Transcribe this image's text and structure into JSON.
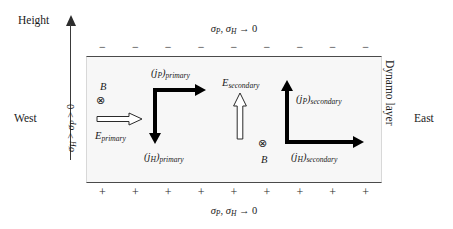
{
  "figure": {
    "axis": {
      "height_label": "Height",
      "conductivity_inequality": "σH > σP > 0"
    },
    "boundaries": {
      "top_label": "σP, σH → 0",
      "bottom_label": "σP, σH → 0",
      "top_sign": "−",
      "bottom_sign": "+",
      "sign_count": 9
    },
    "sides": {
      "west": "West",
      "east": "East",
      "layer": "Dynamo layer"
    },
    "primary": {
      "field_symbol": "B",
      "field_direction_icon": "otimes-into-page-icon",
      "field_direction_glyph": "⊗",
      "efield_label_base": "E",
      "efield_label_sub": "primary",
      "efield_direction": "right",
      "pedersen_base": "(jP)",
      "pedersen_sub": "primary",
      "pedersen_direction": "right",
      "hall_base": "(jH)",
      "hall_sub": "primary",
      "hall_direction": "down"
    },
    "secondary": {
      "field_symbol": "B",
      "field_direction_icon": "otimes-into-page-icon",
      "field_direction_glyph": "⊗",
      "efield_label_base": "E",
      "efield_label_sub": "secondary",
      "efield_direction": "up",
      "pedersen_base": "(jP)",
      "pedersen_sub": "secondary",
      "pedersen_direction": "up",
      "hall_base": "(jH)",
      "hall_sub": "secondary",
      "hall_direction": "right"
    },
    "colors": {
      "ink": "#1a1a1a",
      "arrow": "#000000",
      "layer_fill": "#f7f7f7",
      "layer_border": "#4a4a4a",
      "background": "#ffffff"
    }
  }
}
